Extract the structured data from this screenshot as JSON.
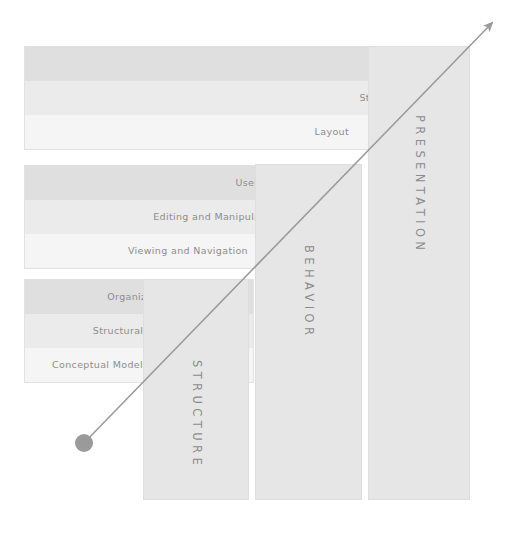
{
  "diagram": {
    "arrow": {
      "name": "abstraction-arrow",
      "from": [
        84,
        443
      ],
      "to": [
        492,
        23
      ],
      "color": "#9b9b9b",
      "dot_color": "#9a9a9a",
      "dot_radius": 9
    },
    "palette": {
      "bar_dark": "#dfdfdf",
      "bar_mid": "#ebebeb",
      "bar_light": "#f5f5f5",
      "pillar_fill": "#e6e6e6",
      "pillar_border": "#dedede",
      "group_border": "#e2e2e2",
      "text": "#8d8d8d",
      "pillar_text": "#8c8c8c",
      "background": "#ffffff"
    },
    "groups": [
      {
        "id": "presentation-group",
        "x": 24,
        "y": 46,
        "width": 446,
        "height": 104,
        "bars": [
          {
            "label": "Text",
            "shade": "bar_dark",
            "label_right": 46
          },
          {
            "label": "Style",
            "shade": "bar_mid",
            "label_right": 84
          },
          {
            "label": "Layout",
            "shade": "bar_light",
            "label_right": 120
          }
        ]
      },
      {
        "id": "behavior-group",
        "x": 24,
        "y": 165,
        "width": 333,
        "height": 104,
        "bars": [
          {
            "label": "User Assistance",
            "shade": "bar_dark",
            "label_right": 40
          },
          {
            "label": "Editing and Manipulation",
            "shade": "bar_mid",
            "label_right": 76
          },
          {
            "label": "Viewing and Navigation",
            "shade": "bar_light",
            "label_right": 108
          }
        ]
      },
      {
        "id": "structure-group",
        "x": 24,
        "y": 279,
        "width": 230,
        "height": 104,
        "bars": [
          {
            "label": "Organizational Model",
            "shade": "bar_dark",
            "label_right": 38
          },
          {
            "label": "Structural Model",
            "shade": "bar_mid",
            "label_right": 76
          },
          {
            "label": "Conceptual Model",
            "shade": "bar_light",
            "label_right": 110
          }
        ]
      }
    ],
    "pillars": [
      {
        "id": "pillar-structure",
        "label": "STRUCTURE",
        "x": 143,
        "y": 279,
        "width": 106,
        "height": 221,
        "label_top": 80
      },
      {
        "id": "pillar-behavior",
        "label": "BEHAVIOR",
        "x": 255,
        "y": 164,
        "width": 107,
        "height": 336,
        "label_top": 80
      },
      {
        "id": "pillar-presentation",
        "label": "PRESENTATION",
        "x": 368,
        "y": 46,
        "width": 102,
        "height": 454,
        "label_top": 68
      }
    ]
  }
}
